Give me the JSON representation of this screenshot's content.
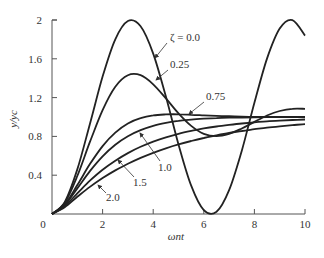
{
  "chart_data": {
    "type": "line",
    "title": "",
    "xlabel": "ωnt",
    "ylabel": "y/yc",
    "xlim": [
      0,
      10
    ],
    "ylim": [
      0,
      2
    ],
    "xticks": [
      0,
      2,
      4,
      6,
      8,
      10
    ],
    "xtick_labels": [
      "0",
      "2",
      "4",
      "6",
      "8",
      "10"
    ],
    "yticks": [
      0.4,
      0.8,
      1.2,
      1.6,
      2
    ],
    "ytick_labels": [
      "0.4",
      "0.8",
      "1.2",
      "1.6",
      "2"
    ],
    "grid": false,
    "legend": "inline annotations",
    "x": [
      0,
      0.5,
      1,
      1.5,
      2,
      2.5,
      3,
      3.5,
      4,
      4.5,
      5,
      5.5,
      6,
      6.5,
      7,
      7.5,
      8,
      8.5,
      9,
      9.5,
      10
    ],
    "series": [
      {
        "name": "ζ = 0.0",
        "values": [
          0,
          0.122,
          0.46,
          0.929,
          1.416,
          1.801,
          1.99,
          1.936,
          1.654,
          1.211,
          0.717,
          0.292,
          0.04,
          0.023,
          0.246,
          0.653,
          1.146,
          1.602,
          1.911,
          1.999,
          1.839
        ]
      },
      {
        "name": "0.25",
        "values": [
          0,
          0.113,
          0.392,
          0.743,
          1.07,
          1.311,
          1.43,
          1.431,
          1.337,
          1.192,
          1.037,
          0.908,
          0.827,
          0.803,
          0.826,
          0.881,
          0.95,
          1.015,
          1.062,
          1.085,
          1.085
        ]
      },
      {
        "name": "0.75",
        "values": [
          0,
          0.097,
          0.298,
          0.514,
          0.7,
          0.839,
          0.933,
          0.988,
          1.017,
          1.027,
          1.028,
          1.023,
          1.017,
          1.012,
          1.008,
          1.004,
          1.002,
          1.001,
          1.0,
          1.0,
          1.0
        ]
      },
      {
        "name": "1.0",
        "values": [
          0,
          0.09,
          0.264,
          0.442,
          0.594,
          0.713,
          0.801,
          0.864,
          0.908,
          0.939,
          0.96,
          0.973,
          0.983,
          0.989,
          0.993,
          0.995,
          0.997,
          0.998,
          0.999,
          0.999,
          1.0
        ]
      },
      {
        "name": "1.5",
        "values": [
          0,
          0.079,
          0.213,
          0.343,
          0.456,
          0.549,
          0.628,
          0.693,
          0.746,
          0.79,
          0.827,
          0.857,
          0.882,
          0.902,
          0.919,
          0.933,
          0.945,
          0.955,
          0.962,
          0.969,
          0.974
        ]
      },
      {
        "name": "2.0",
        "values": [
          0,
          0.07,
          0.178,
          0.279,
          0.37,
          0.449,
          0.518,
          0.578,
          0.631,
          0.677,
          0.718,
          0.753,
          0.784,
          0.811,
          0.835,
          0.856,
          0.874,
          0.89,
          0.903,
          0.916,
          0.926
        ]
      }
    ],
    "annotations": [
      {
        "text": "ζ = 0.0",
        "x": 170,
        "y": 41,
        "lx1": 167,
        "ly1": 43,
        "lx2": 155,
        "ly2": 58
      },
      {
        "text": "0.25",
        "x": 170,
        "y": 68,
        "lx1": 168,
        "ly1": 70,
        "lx2": 156,
        "ly2": 80
      },
      {
        "text": "0.75",
        "x": 206,
        "y": 100,
        "lx1": 204,
        "ly1": 102,
        "lx2": 189,
        "ly2": 114
      },
      {
        "text": "1.0",
        "x": 158,
        "y": 171,
        "lx1": 160,
        "ly1": 161,
        "lx2": 140,
        "ly2": 133
      },
      {
        "text": "1.5",
        "x": 133,
        "y": 186,
        "lx1": 134,
        "ly1": 177,
        "lx2": 118,
        "ly2": 160
      },
      {
        "text": "2.0",
        "x": 106,
        "y": 201,
        "lx1": 106,
        "ly1": 193,
        "lx2": 98,
        "ly2": 185
      }
    ]
  },
  "plot": {
    "x0": 52,
    "x1": 305,
    "y0": 214,
    "y1": 20
  }
}
